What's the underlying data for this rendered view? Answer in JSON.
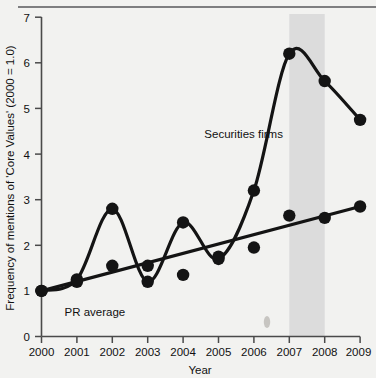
{
  "chart_data": {
    "type": "line",
    "title": "",
    "xlabel": "Year",
    "ylabel": "Frequency of mentions of 'Core Values' (2000 = 1.0)",
    "categories": [
      "2000",
      "2001",
      "2002",
      "2003",
      "2004",
      "2005",
      "2006",
      "2007",
      "2008",
      "2009"
    ],
    "x": [
      2000,
      2001,
      2002,
      2003,
      2004,
      2005,
      2006,
      2007,
      2008,
      2009
    ],
    "xlim": [
      2000,
      2009
    ],
    "ylim": [
      0,
      7
    ],
    "yticks": [
      0,
      1,
      2,
      3,
      4,
      5,
      6,
      7
    ],
    "xticks": [
      2000,
      2001,
      2002,
      2003,
      2004,
      2005,
      2006,
      2007,
      2008,
      2009
    ],
    "grid": false,
    "legend_position": "inline-annotations",
    "series": [
      {
        "name": "Securities firms",
        "style": "smooth-curve-with-markers",
        "values": [
          1.0,
          1.25,
          2.8,
          1.2,
          2.5,
          1.7,
          3.2,
          6.2,
          5.6,
          4.75
        ]
      },
      {
        "name": "PR average",
        "style": "straight-trend-line-with-markers",
        "values": [
          1.0,
          1.2,
          1.55,
          1.55,
          1.35,
          1.75,
          1.95,
          2.65,
          2.6,
          2.85
        ]
      }
    ],
    "annotations": [
      {
        "text": "Securities firms",
        "x": 2004.6,
        "y": 4.35
      },
      {
        "text": "PR average",
        "x": 2000.65,
        "y": 0.45
      }
    ],
    "shaded_band": {
      "label": "",
      "x_start": 2007,
      "x_end": 2008,
      "color": "#dcdcdc"
    },
    "colors": {
      "line": "#141414",
      "marker": "#141414",
      "axis": "#4a4a4a",
      "background": "#f2f2f0",
      "shade": "#dcdcdc"
    }
  },
  "axes": {
    "y_tick_labels": [
      "0",
      "1",
      "2",
      "3",
      "4",
      "5",
      "6",
      "7"
    ],
    "x_tick_labels": [
      "2000",
      "2001",
      "2002",
      "2003",
      "2004",
      "2005",
      "2006",
      "2007",
      "2008",
      "2009"
    ],
    "y_axis_title": "Frequency of mentions of 'Core Values' (2000 = 1.0)",
    "x_axis_title": "Year"
  },
  "labels": {
    "securities_firms": "Securities firms",
    "pr_average": "PR average"
  }
}
